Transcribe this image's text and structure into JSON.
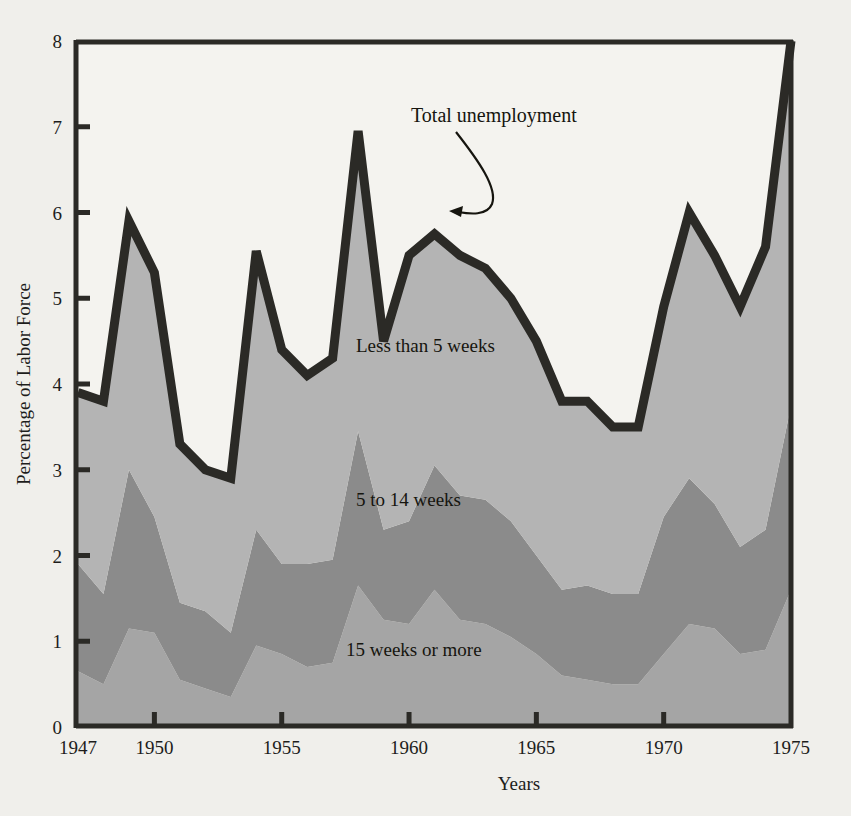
{
  "figure": {
    "background_color": "#f0efeb",
    "plot_border_color": "#2b2a26",
    "title": ""
  },
  "axes": {
    "x_title": "Years",
    "y_title": "Percentage of Labor Force",
    "x_tick_labels": [
      "1947",
      "1950",
      "1955",
      "1960",
      "1965",
      "1970",
      "1975"
    ],
    "y_tick_labels": [
      "0",
      "1",
      "2",
      "3",
      "4",
      "5",
      "6",
      "7",
      "8"
    ]
  },
  "annotations": {
    "total_unemployment": "Total unemployment"
  },
  "band_labels": {
    "top": "Less than 5 weeks",
    "middle": "5 to 14 weeks",
    "bottom": "15 weeks or more"
  },
  "chart_data": {
    "type": "area",
    "title": "",
    "subtitle": "",
    "xlabel": "Years",
    "ylabel": "Percentage of Labor Force",
    "xlim": [
      1947,
      1975
    ],
    "ylim": [
      0,
      8
    ],
    "x_ticks": [
      1947,
      1950,
      1955,
      1960,
      1965,
      1970,
      1975
    ],
    "y_ticks": [
      0,
      1,
      2,
      3,
      4,
      5,
      6,
      7,
      8
    ],
    "grid": false,
    "legend_position": "inline-labels",
    "stacked": true,
    "stack_order_bottom_to_top": [
      "15 weeks or more",
      "5 to 14 weeks",
      "Less than 5 weeks"
    ],
    "x": [
      1947,
      1948,
      1949,
      1950,
      1951,
      1952,
      1953,
      1954,
      1955,
      1956,
      1957,
      1958,
      1959,
      1960,
      1961,
      1962,
      1963,
      1964,
      1965,
      1966,
      1967,
      1968,
      1969,
      1970,
      1971,
      1972,
      1973,
      1974,
      1975
    ],
    "series": [
      {
        "name": "15 weeks or more",
        "color": "#a5a5a5",
        "values": [
          0.65,
          0.5,
          1.15,
          1.1,
          0.55,
          0.45,
          0.35,
          0.95,
          0.85,
          0.7,
          0.75,
          1.65,
          1.25,
          1.2,
          1.6,
          1.25,
          1.2,
          1.05,
          0.85,
          0.6,
          0.55,
          0.5,
          0.5,
          0.85,
          1.2,
          1.15,
          0.85,
          0.9,
          1.6
        ]
      },
      {
        "name": "5 to 14 weeks",
        "color": "#8b8b8b",
        "values": [
          1.25,
          1.05,
          1.85,
          1.35,
          0.9,
          0.9,
          0.75,
          1.35,
          1.05,
          1.2,
          1.2,
          1.8,
          1.05,
          1.2,
          1.45,
          1.45,
          1.45,
          1.35,
          1.15,
          1.0,
          1.1,
          1.05,
          1.05,
          1.6,
          1.7,
          1.45,
          1.25,
          1.4,
          2.15
        ]
      },
      {
        "name": "Less than 5 weeks",
        "color": "#b4b4b4",
        "values": [
          2.0,
          2.25,
          2.9,
          2.85,
          1.85,
          1.65,
          1.8,
          3.25,
          2.5,
          2.2,
          2.35,
          3.5,
          2.2,
          3.1,
          2.7,
          2.8,
          2.7,
          2.6,
          2.5,
          2.2,
          2.15,
          1.95,
          1.95,
          2.45,
          3.1,
          2.9,
          2.8,
          3.3,
          4.25
        ]
      }
    ],
    "total_unemployment": {
      "name": "Total unemployment",
      "color": "#2b2a26",
      "values": [
        3.9,
        3.8,
        5.9,
        5.3,
        3.3,
        3.0,
        2.9,
        5.55,
        4.4,
        4.1,
        4.3,
        6.95,
        4.5,
        5.5,
        5.75,
        5.5,
        5.35,
        5.0,
        4.5,
        3.8,
        3.8,
        3.5,
        3.5,
        4.9,
        6.0,
        5.5,
        4.9,
        5.6,
        8.0
      ]
    }
  }
}
